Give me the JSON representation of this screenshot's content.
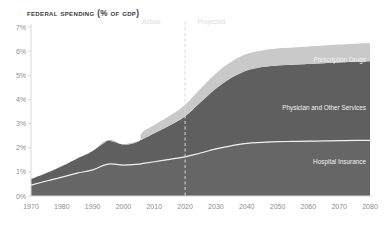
{
  "chart_data": {
    "type": "area",
    "title": "Federal Spending (% of GDP)",
    "xlabel": "",
    "ylabel": "",
    "stacked": true,
    "grid": false,
    "legend_position": "inline-annotations",
    "xlim": [
      1970,
      2080
    ],
    "ylim": [
      0,
      7
    ],
    "ytick_suffix": "%",
    "x_ticks": [
      1970,
      1980,
      1990,
      2000,
      2010,
      2020,
      2030,
      2040,
      2050,
      2060,
      2070,
      2080
    ],
    "y_ticks": [
      0,
      1,
      2,
      3,
      4,
      5,
      6,
      7
    ],
    "y_tick_labels": [
      "0%",
      "1%",
      "2%",
      "3%",
      "4%",
      "5%",
      "6%",
      "7%"
    ],
    "annotations": [
      {
        "text": "Actual",
        "x": 2012,
        "align": "end"
      },
      {
        "text": "Projected",
        "x": 2024,
        "align": "start"
      }
    ],
    "divider": {
      "x": 2020,
      "style": "dashed",
      "color": "#d8d8d8"
    },
    "colors": {
      "hospital_insurance": "#666666",
      "physician_and_other_services": "#5f5f5f",
      "prescription_drugs": "#c9c9c9",
      "separator_line": "#f0f0f0",
      "axis": "#d9d9d9",
      "tick_text": "#8d8d8d",
      "title_text": "#3b3b3b"
    },
    "x": [
      1970,
      1975,
      1980,
      1985,
      1990,
      1995,
      2000,
      2005,
      2006,
      2010,
      2015,
      2020,
      2025,
      2030,
      2035,
      2040,
      2045,
      2050,
      2055,
      2060,
      2065,
      2070,
      2075,
      2080
    ],
    "series": [
      {
        "name": "Hospital Insurance",
        "label": "Hospital Insurance",
        "color": "#666666",
        "values": [
          0.45,
          0.62,
          0.78,
          0.95,
          1.08,
          1.32,
          1.28,
          1.32,
          1.34,
          1.42,
          1.52,
          1.62,
          1.78,
          1.95,
          2.08,
          2.18,
          2.22,
          2.25,
          2.26,
          2.27,
          2.28,
          2.29,
          2.3,
          2.3
        ]
      },
      {
        "name": "Physician and Other Services",
        "label": "Physician and Other Services",
        "color": "#5f5f5f",
        "values": [
          0.25,
          0.33,
          0.45,
          0.6,
          0.78,
          0.98,
          0.85,
          0.95,
          1.0,
          1.18,
          1.4,
          1.68,
          2.1,
          2.5,
          2.82,
          3.02,
          3.12,
          3.16,
          3.18,
          3.2,
          3.22,
          3.24,
          3.26,
          3.28
        ]
      },
      {
        "name": "Prescription Drugs",
        "label": "Prescription Drugs",
        "color": "#c9c9c9",
        "values": [
          0,
          0,
          0,
          0,
          0,
          0,
          0,
          0,
          0.28,
          0.34,
          0.4,
          0.48,
          0.56,
          0.62,
          0.66,
          0.68,
          0.69,
          0.7,
          0.71,
          0.72,
          0.73,
          0.74,
          0.75,
          0.76
        ]
      }
    ],
    "totals": [
      0.7,
      0.95,
      1.23,
      1.55,
      1.86,
      2.3,
      2.13,
      2.27,
      2.62,
      2.94,
      3.32,
      3.78,
      4.44,
      5.07,
      5.56,
      5.88,
      6.03,
      6.11,
      6.15,
      6.19,
      6.23,
      6.27,
      6.31,
      6.34
    ]
  }
}
